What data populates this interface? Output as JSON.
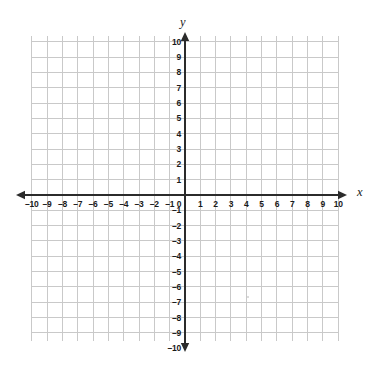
{
  "chart_data": {
    "type": "scatter",
    "title": "",
    "subtitle": "",
    "xlabel": "x",
    "ylabel": "y",
    "xlim": [
      -10,
      10
    ],
    "ylim": [
      -10,
      10
    ],
    "grid": true,
    "legend": null,
    "series": [],
    "x_tick_labels": [
      "–10",
      "–9",
      "–8",
      "–7",
      "–6",
      "–5",
      "–4",
      "–3",
      "–2",
      "–1",
      "0",
      "1",
      "2",
      "3",
      "4",
      "5",
      "6",
      "7",
      "8",
      "9",
      "10"
    ],
    "x_tick_values": [
      -10,
      -9,
      -8,
      -7,
      -6,
      -5,
      -4,
      -3,
      -2,
      -1,
      0,
      1,
      2,
      3,
      4,
      5,
      6,
      7,
      8,
      9,
      10
    ],
    "y_tick_labels": [
      "10",
      "9",
      "8",
      "7",
      "6",
      "5",
      "4",
      "3",
      "2",
      "1",
      "–1",
      "–2",
      "–3",
      "–4",
      "–5",
      "–6",
      "–7",
      "–8",
      "–9",
      "–10"
    ],
    "y_tick_values": [
      10,
      9,
      8,
      7,
      6,
      5,
      4,
      3,
      2,
      1,
      -1,
      -2,
      -3,
      -4,
      -5,
      -6,
      -7,
      -8,
      -9,
      -10
    ],
    "origin_label": "0",
    "annotations": [],
    "colors": {
      "grid": "#c9c9c9",
      "axis": "#2b2b2b",
      "label": "#1a1a1a",
      "background": "#ffffff"
    }
  },
  "axes": {
    "x_axis_name": "x",
    "y_axis_name": "y"
  }
}
